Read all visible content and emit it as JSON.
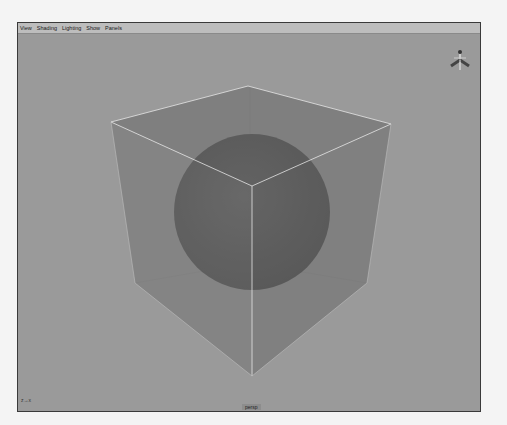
{
  "menu": {
    "items": [
      {
        "label": "View"
      },
      {
        "label": "Shading"
      },
      {
        "label": "Lighting"
      },
      {
        "label": "Show"
      },
      {
        "label": "Panels"
      }
    ]
  },
  "viewport": {
    "camera_label": "persp",
    "axis_gizmo_label": "z→x",
    "background_color": "#9a9a9a"
  },
  "scene": {
    "objects": [
      {
        "name": "cube",
        "type": "transparent cube",
        "edge_color": "#e0e0e0",
        "face_color": "#6f6f6f"
      },
      {
        "name": "sphere",
        "type": "sphere",
        "color": "#4e4e4e"
      }
    ]
  },
  "view_cube": {
    "axes": [
      "Y",
      "X",
      "Z"
    ]
  }
}
